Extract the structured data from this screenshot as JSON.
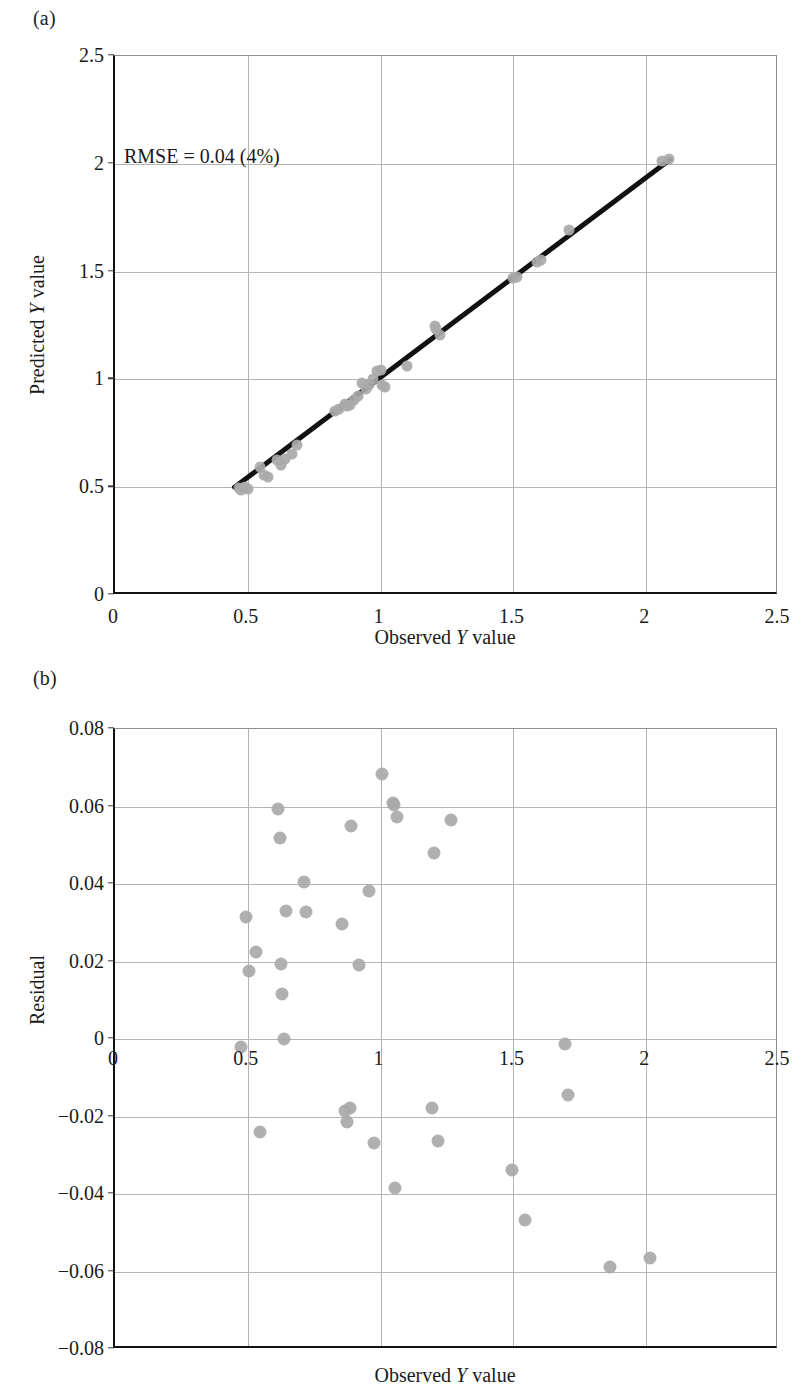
{
  "figure": {
    "panels": [
      {
        "key": "a",
        "label": "(a)",
        "annotation": "RMSE = 0.04 (4%)"
      },
      {
        "key": "b",
        "label": "(b)"
      }
    ]
  },
  "chart_data": [
    {
      "panel": "a",
      "type": "scatter",
      "title": "",
      "xlabel": "Observed Y value",
      "ylabel": "Predicted Y value",
      "xlim": [
        0,
        2.5
      ],
      "ylim": [
        0,
        2.5
      ],
      "xticks": [
        0,
        0.5,
        1,
        1.5,
        2,
        2.5
      ],
      "xticklabels": [
        "0",
        "0.5",
        "1",
        "1.5",
        "2",
        "2.5"
      ],
      "yticks": [
        0,
        0.5,
        1,
        1.5,
        2,
        2.5
      ],
      "yticklabels": [
        "0",
        "0.5",
        "1",
        "1.5",
        "2",
        "2.5"
      ],
      "grid": true,
      "legend": "none",
      "annotations": [
        {
          "text": "RMSE = 0.04 (4%)",
          "x": 0.14,
          "y": 2.0
        }
      ],
      "marker": {
        "shape": "circle",
        "color": "#a9a9a9",
        "size_px": 11
      },
      "series": [
        {
          "name": "Predicted vs Observed",
          "x": [
            0.465,
            0.475,
            0.49,
            0.5,
            0.545,
            0.56,
            0.575,
            0.61,
            0.625,
            0.64,
            0.665,
            0.685,
            0.83,
            0.845,
            0.865,
            0.875,
            0.885,
            0.9,
            0.915,
            0.93,
            0.945,
            0.955,
            0.97,
            0.985,
            1.0,
            1.005,
            1.015,
            1.1,
            1.205,
            1.21,
            1.225,
            1.5,
            1.515,
            1.59,
            1.605,
            1.71,
            2.06,
            2.085
          ],
          "y": [
            0.495,
            0.485,
            0.5,
            0.49,
            0.595,
            0.555,
            0.545,
            0.625,
            0.605,
            0.63,
            0.655,
            0.695,
            0.855,
            0.865,
            0.885,
            0.875,
            0.88,
            0.905,
            0.925,
            0.985,
            0.955,
            0.975,
            1.0,
            1.04,
            1.045,
            0.975,
            0.965,
            1.06,
            1.25,
            1.235,
            1.205,
            1.47,
            1.475,
            1.545,
            1.555,
            1.695,
            2.015,
            2.02
          ]
        }
      ],
      "fit_line": {
        "x": [
          0.45,
          2.09
        ],
        "y": [
          0.5,
          2.02
        ],
        "color": "#111111",
        "width_px": 5
      }
    },
    {
      "panel": "b",
      "type": "scatter",
      "title": "",
      "xlabel": "Observed Y value",
      "ylabel": "Residual",
      "xlim": [
        0,
        2.5
      ],
      "ylim": [
        -0.08,
        0.08
      ],
      "xticks": [
        0,
        0.5,
        1,
        1.5,
        2,
        2.5
      ],
      "xticklabels": [
        "0",
        "0.5",
        "1",
        "1.5",
        "2",
        "2.5"
      ],
      "yticks": [
        -0.08,
        -0.06,
        -0.04,
        -0.02,
        0,
        0.02,
        0.04,
        0.06,
        0.08
      ],
      "yticklabels": [
        "−0.08",
        "−0.06",
        "−0.04",
        "−0.02",
        "0",
        "0.02",
        "0.04",
        "0.06",
        "0.08"
      ],
      "grid": true,
      "legend": "none",
      "marker": {
        "shape": "circle",
        "color": "#a9a9a9",
        "size_px": 13
      },
      "series": [
        {
          "name": "Residuals",
          "x": [
            0.475,
            0.495,
            0.505,
            0.53,
            0.545,
            0.615,
            0.62,
            0.625,
            0.63,
            0.635,
            0.645,
            0.71,
            0.72,
            0.855,
            0.865,
            0.875,
            0.885,
            0.89,
            0.92,
            0.955,
            0.975,
            1.005,
            1.045,
            1.05,
            1.055,
            1.06,
            1.195,
            1.2,
            1.215,
            1.265,
            1.495,
            1.545,
            1.695,
            1.705,
            1.865,
            2.015
          ],
          "y": [
            -0.002,
            0.0315,
            0.0175,
            0.0225,
            -0.024,
            0.0593,
            0.052,
            0.0193,
            0.0115,
            0.0,
            0.033,
            0.0405,
            0.0328,
            0.0298,
            -0.0185,
            -0.0215,
            -0.0178,
            0.055,
            0.019,
            0.0383,
            -0.0268,
            0.0683,
            0.061,
            0.0603,
            -0.0385,
            0.0573,
            -0.0178,
            0.048,
            -0.0263,
            0.0565,
            -0.0338,
            -0.0468,
            -0.0013,
            -0.0145,
            -0.0588,
            -0.0565
          ]
        }
      ]
    }
  ]
}
